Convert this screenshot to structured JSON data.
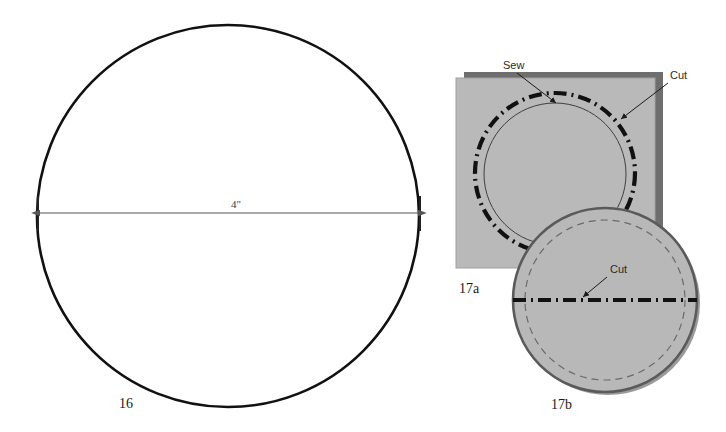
{
  "page": {
    "background_color": "#ffffff",
    "width": 726,
    "height": 432
  },
  "palette": {
    "outline_black": "#111111",
    "fabric_fill": "#b9b9b9",
    "fabric_shadow": "#6e6e6e",
    "circle_fill": "#b8b8b8",
    "circle_edge": "#5a5a5a",
    "dash_gray": "#6a6a6a",
    "dimension_line": "#555555",
    "label_text": "#1a1a1a",
    "callout_text": "#2b2b2b"
  },
  "figures": [
    {
      "id": "fig-16",
      "number_label": "16",
      "shape": "circle",
      "description": "Large open circle pattern piece with horizontal diameter dimension",
      "center_x": 228,
      "center_y": 216,
      "radius": 191,
      "stroke_width": 2.6,
      "dimension": {
        "value_label": "4\"",
        "orientation": "horizontal",
        "x_start": 38,
        "x_end": 420,
        "y": 213,
        "label_x": 236,
        "label_y": 208,
        "arrowheads": "both",
        "has_end_ticks": true
      },
      "label_x": 126,
      "label_y": 408
    },
    {
      "id": "fig-17a",
      "number_label": "17a",
      "shape": "square-with-circles",
      "description": "Gray fabric square with thin sew circle and bold dash-dot cut circle",
      "square": {
        "x": 456,
        "y": 78,
        "width": 199,
        "height": 190,
        "fill": "#b9b9b9",
        "shadow_offset_x": 8,
        "shadow_offset_y": -6,
        "shadow_fill": "#6e6e6e"
      },
      "sew_circle": {
        "center_x": 555,
        "center_y": 174,
        "radius": 71,
        "stroke": "#3f3f3f",
        "stroke_width": 1,
        "style": "solid"
      },
      "cut_circle": {
        "center_x": 555,
        "center_y": 173,
        "radius": 80,
        "stroke": "#111111",
        "stroke_width": 4.2,
        "style": "dash-dot"
      },
      "callouts": [
        {
          "text": "Sew",
          "label_x": 503,
          "label_y": 69,
          "line_x1": 517,
          "line_y1": 73,
          "line_x2": 556,
          "line_y2": 103,
          "arrow": "end"
        },
        {
          "text": "Cut",
          "label_x": 670,
          "label_y": 79,
          "line_x1": 668,
          "line_y1": 83,
          "line_x2": 621,
          "line_y2": 119,
          "arrow": "end"
        }
      ],
      "label_x": 459,
      "label_y": 293
    },
    {
      "id": "fig-17b",
      "number_label": "17b",
      "shape": "circle-folded",
      "description": "Gray circular fabric piece with dashed seam line and bold dash-dot cut line across the middle",
      "disc": {
        "center_x": 605,
        "center_y": 300,
        "radius": 92,
        "fill": "#b8b8b8",
        "stroke": "#5a5a5a",
        "stroke_width": 2.6,
        "shadow_offset_x": 3,
        "shadow_offset_y": 3,
        "shadow_fill": "#9a9a9a"
      },
      "seam_circle": {
        "center_x": 605,
        "center_y": 300,
        "radius": 80,
        "stroke": "#6a6a6a",
        "stroke_width": 1.2,
        "style": "dashed"
      },
      "cut_line": {
        "x1": 513,
        "x2": 697,
        "y": 300,
        "stroke": "#111111",
        "stroke_width": 4.0,
        "style": "dash-dot"
      },
      "callouts": [
        {
          "text": "Cut",
          "label_x": 610,
          "label_y": 273,
          "line_x1": 607,
          "line_y1": 277,
          "line_x2": 583,
          "line_y2": 297,
          "arrow": "end"
        }
      ],
      "label_x": 551,
      "label_y": 409
    }
  ]
}
